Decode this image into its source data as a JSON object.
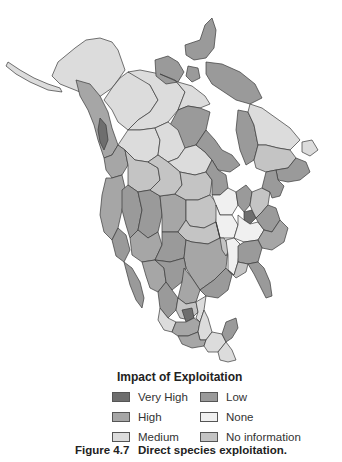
{
  "figure": {
    "number": "Figure 4.7",
    "caption": "Direct species exploitation."
  },
  "legend": {
    "title": "Impact of Exploitation",
    "items": [
      {
        "label": "Very High",
        "color": "#6e6e6e"
      },
      {
        "label": "High",
        "color": "#a6a6a6"
      },
      {
        "label": "Medium",
        "color": "#dcdcdc"
      },
      {
        "label": "Low",
        "color": "#9a9a9a"
      },
      {
        "label": "None",
        "color": "#f0f0f0"
      },
      {
        "label": "No information",
        "color": "#c4c4c4"
      }
    ]
  },
  "map": {
    "region": "North America",
    "colors": {
      "very_high": "#6e6e6e",
      "high": "#a6a6a6",
      "medium": "#dcdcdc",
      "low": "#9a9a9a",
      "none": "#f0f0f0",
      "no_info": "#c4c4c4",
      "water": "#ffffff",
      "border": "#3a3a3a"
    }
  }
}
